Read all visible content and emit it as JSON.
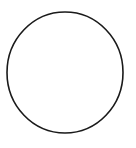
{
  "canvas": {
    "width": 136,
    "height": 148,
    "background": "#ffffff"
  },
  "shapes": [
    {
      "type": "ellipse",
      "cx": 65,
      "cy": 72.5,
      "rx": 58,
      "ry": 60.5,
      "fill": "none",
      "stroke": "#1a1a1a",
      "stroke_width": 1.6
    }
  ]
}
